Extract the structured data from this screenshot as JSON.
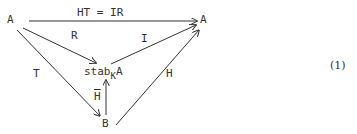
{
  "diagram": {
    "type": "commutative-diagram",
    "nodes": [
      {
        "id": "A_left",
        "label": "A"
      },
      {
        "id": "A_right",
        "label": "A"
      },
      {
        "id": "stab",
        "label": "stab",
        "subscript": "K",
        "suffix": "A"
      },
      {
        "id": "B",
        "label": "B"
      }
    ],
    "arrows": [
      {
        "from": "A_left",
        "to": "A_right",
        "label": "HT = IR"
      },
      {
        "from": "A_left",
        "to": "stab",
        "label": "R"
      },
      {
        "from": "stab",
        "to": "A_right",
        "label": "I"
      },
      {
        "from": "A_left",
        "to": "B",
        "label": "T"
      },
      {
        "from": "B",
        "to": "A_right",
        "label": "H"
      },
      {
        "from": "B",
        "to": "stab",
        "label": "H",
        "overline": true
      }
    ],
    "equation_number": "(1)"
  }
}
